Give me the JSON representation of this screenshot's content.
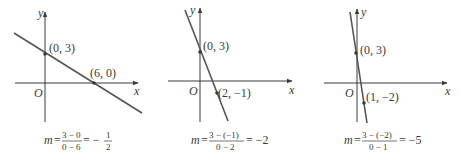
{
  "panels": [
    {
      "id": "panel-1",
      "y_axis_label": "y",
      "x_axis_label": "x",
      "origin_label": "O",
      "points": [
        {
          "label": "(0, 3)",
          "x": 0,
          "y": 3
        },
        {
          "label": "(6, 0)",
          "x": 6,
          "y": 0
        }
      ],
      "formula": {
        "m": "m",
        "eq": "=",
        "num": "3 − 0",
        "den": "0 − 6",
        "result_sign": "= −",
        "result_num": "1",
        "result_den": "2"
      },
      "slope": -0.5
    },
    {
      "id": "panel-2",
      "y_axis_label": "y",
      "x_axis_label": "x",
      "origin_label": "O",
      "points": [
        {
          "label": "(0, 3)",
          "x": 0,
          "y": 3
        },
        {
          "label": "(2, −1)",
          "x": 2,
          "y": -1
        }
      ],
      "formula": {
        "m": "m",
        "eq": "=",
        "num": "3 − (−1)",
        "den": "0 − 2",
        "result": "= −2"
      },
      "slope": -2
    },
    {
      "id": "panel-3",
      "y_axis_label": "y",
      "x_axis_label": "x",
      "origin_label": "O",
      "points": [
        {
          "label": "(0, 3)",
          "x": 0,
          "y": 3
        },
        {
          "label": "(1, −2)",
          "x": 1,
          "y": -2
        }
      ],
      "formula": {
        "m": "m",
        "eq": "=",
        "num": "3 − (−2)",
        "den": "0 − 1",
        "result": "= −5"
      },
      "slope": -5
    }
  ],
  "colors": {
    "line": "#555555",
    "axis": "#3a3a3a",
    "text": "#3a3a3a"
  }
}
